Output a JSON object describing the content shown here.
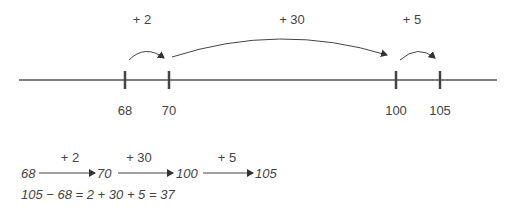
{
  "number_line": {
    "ticks": [
      {
        "value": "68",
        "x": 125
      },
      {
        "value": "70",
        "x": 169
      },
      {
        "value": "100",
        "x": 396
      },
      {
        "value": "105",
        "x": 440
      }
    ],
    "jumps": [
      {
        "label": "+ 2",
        "from": "68",
        "to": "70"
      },
      {
        "label": "+ 30",
        "from": "70",
        "to": "100"
      },
      {
        "label": "+ 5",
        "from": "100",
        "to": "105"
      }
    ]
  },
  "chain": {
    "nodes": [
      "68",
      "70",
      "100",
      "105"
    ],
    "steps": [
      "+ 2",
      "+ 30",
      "+ 5"
    ]
  },
  "equation": "105 − 68 = 2 + 30 + 5 = 37"
}
